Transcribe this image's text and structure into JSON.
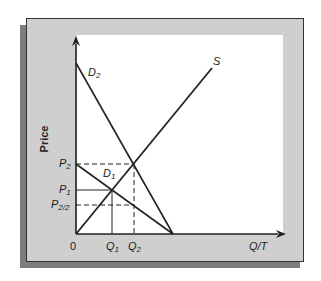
{
  "diagram": {
    "type": "supply-demand",
    "y_axis_label": "Price",
    "x_axis_label": "Q/T",
    "origin_label": "0",
    "curves": {
      "supply": {
        "label": "S"
      },
      "demand_1": {
        "label_main": "D",
        "label_sub": "1"
      },
      "demand_2": {
        "label_main": "D",
        "label_sub": "2"
      }
    },
    "price_levels": [
      {
        "main": "P",
        "sub": "2"
      },
      {
        "main": "P",
        "sub": "1"
      },
      {
        "main": "P",
        "sub": "2/2"
      }
    ],
    "quantity_levels": [
      {
        "main": "Q",
        "sub": "1"
      },
      {
        "main": "Q",
        "sub": "2"
      }
    ],
    "colors": {
      "panel": "#cfcfcf",
      "shadow": "#7d7d7d",
      "plot_background": "#ffffff",
      "lines": "#222222"
    }
  }
}
